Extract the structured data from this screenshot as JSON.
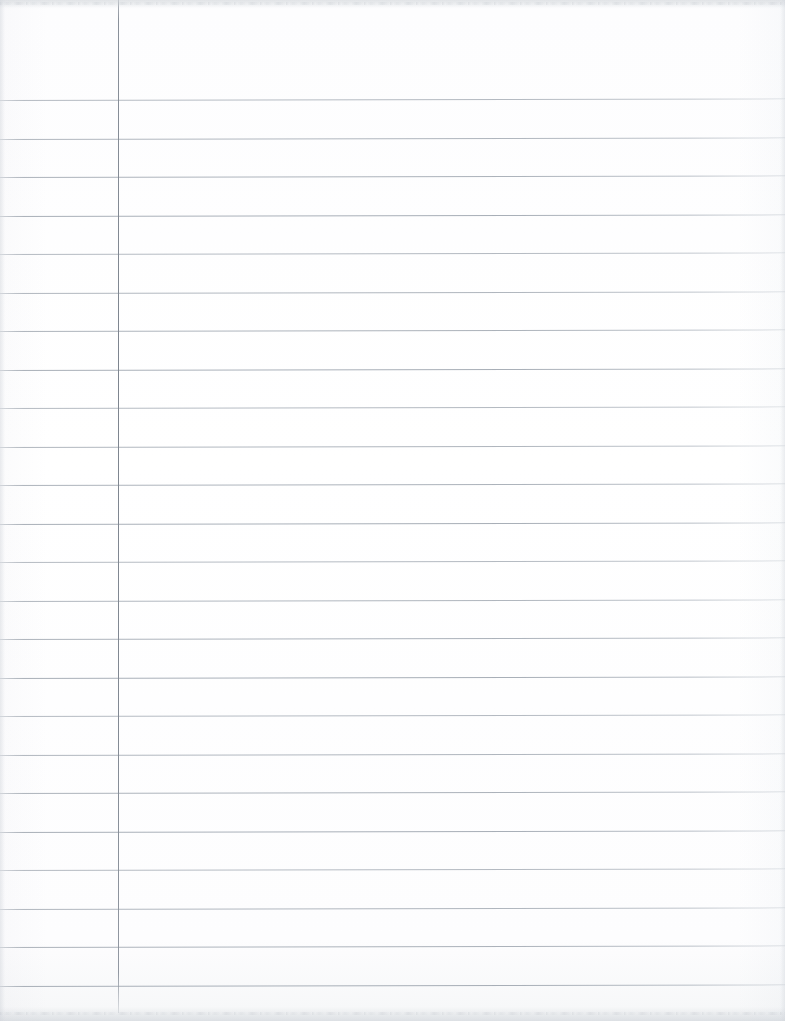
{
  "document": {
    "kind": "scanned-lined-notebook-paper",
    "title": "Blank ruled notebook page",
    "content_text": "",
    "page_width_px": 785,
    "page_height_px": 1021,
    "background_color": "#fdfdfd",
    "is_blank": true
  },
  "paper": {
    "rule_color": "#9aa2ac",
    "margin_rule_color": "#7e858f",
    "margin_rule_x_px": 118,
    "margin_rule_top_px": 0,
    "margin_rule_height_px": 1013,
    "first_rule_y_px": 100,
    "rule_spacing_px": 38.5,
    "rule_count": 24,
    "rule_thickness_px": 1,
    "rule_skew_deg": -0.12,
    "rule_y_positions": [
      100,
      138.5,
      177,
      215.5,
      254,
      292.5,
      331,
      369.5,
      408,
      446.5,
      485,
      523.5,
      562,
      600.5,
      639,
      677.5,
      716,
      754.5,
      793,
      831.5,
      870,
      908.5,
      947,
      985.5
    ]
  },
  "scan": {
    "top_edge_artifact": true,
    "bottom_edge_artifact": true,
    "left_edge_artifact": true,
    "right_edge_artifact": true
  }
}
